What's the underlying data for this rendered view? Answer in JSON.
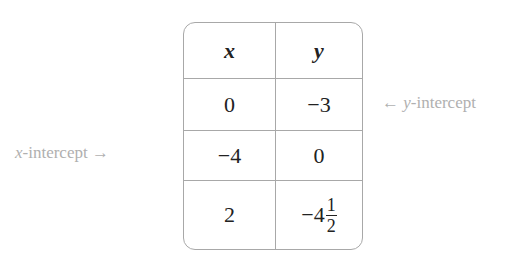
{
  "table": {
    "headers": [
      "x",
      "y"
    ],
    "rows": [
      {
        "x": "0",
        "y": "−3"
      },
      {
        "x": "−4",
        "y": "0"
      },
      {
        "x": "2",
        "y_whole": "−4",
        "y_num": "1",
        "y_den": "2"
      }
    ]
  },
  "annotations": {
    "y_intercept": {
      "arrow": "←",
      "var": "y",
      "text": "-intercept"
    },
    "x_intercept": {
      "var": "x",
      "text": "-intercept",
      "arrow": "→"
    }
  }
}
